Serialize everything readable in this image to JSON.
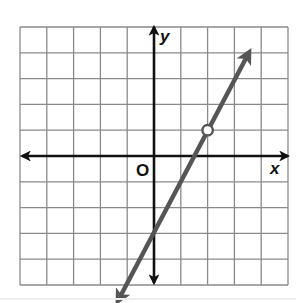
{
  "chart_data": {
    "type": "line",
    "title": "",
    "xlabel": "x",
    "ylabel": "y",
    "origin_label": "O",
    "xlim": [
      -5,
      5
    ],
    "ylim": [
      -5,
      5
    ],
    "grid": true,
    "grid_step": 1,
    "tick_labels": false,
    "series": [
      {
        "name": "line",
        "equation": "y = 2x - 3",
        "slope": 2,
        "y_intercept": -3,
        "x": [
          -1,
          0,
          1,
          2,
          3,
          4
        ],
        "y": [
          -5,
          -3,
          -1,
          1,
          3,
          5
        ],
        "arrows": "both ends",
        "color": "#555555"
      }
    ],
    "annotations": [
      {
        "type": "open-circle",
        "x": 2,
        "y": 1
      }
    ]
  },
  "labels": {
    "x_axis": "x",
    "y_axis": "y",
    "origin": "O"
  },
  "colors": {
    "grid": "#8a8a8a",
    "axes": "#111111",
    "line": "#555555",
    "background": "#ffffff"
  }
}
